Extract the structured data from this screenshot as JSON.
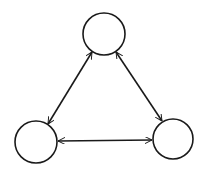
{
  "diagram": {
    "type": "graph",
    "stroke_color": "#1a1a1a",
    "background": "#ffffff",
    "nodes": [
      {
        "id": "top",
        "label": "",
        "cx": 104,
        "cy": 34,
        "r": 21
      },
      {
        "id": "bottom-left",
        "label": "",
        "cx": 36,
        "cy": 142,
        "r": 21
      },
      {
        "id": "bottom-right",
        "label": "",
        "cx": 173,
        "cy": 139,
        "r": 20
      }
    ],
    "edges": [
      {
        "from": "top",
        "to": "bottom-left",
        "bidirectional": true
      },
      {
        "from": "top",
        "to": "bottom-right",
        "bidirectional": true
      },
      {
        "from": "bottom-left",
        "to": "bottom-right",
        "bidirectional": true
      }
    ]
  }
}
